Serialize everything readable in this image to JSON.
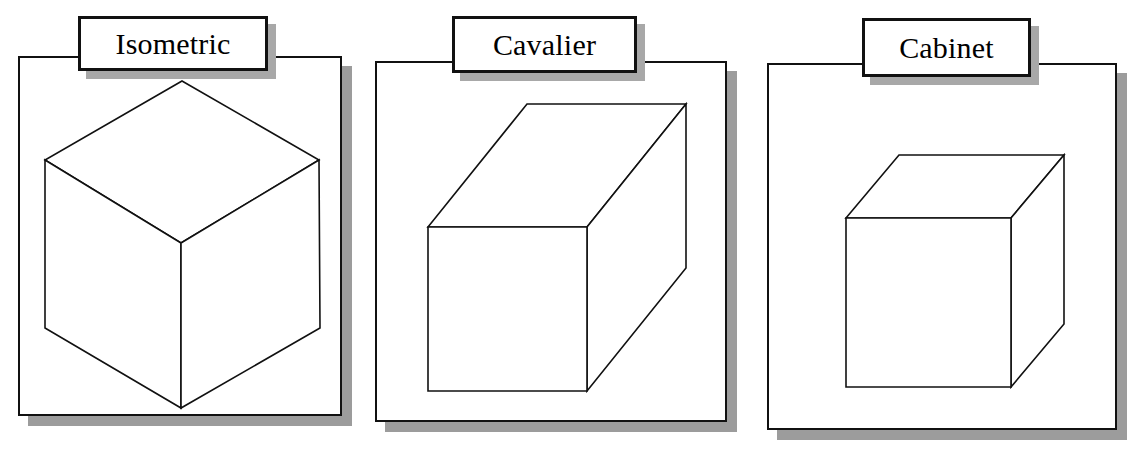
{
  "figure": {
    "background_color": "#ffffff",
    "line_color": "#111111",
    "shadow_color": "#9c9c9c",
    "face_color": "#ffffff"
  },
  "panels": [
    {
      "id": "isometric",
      "label": "Isometric",
      "projection_type": "isometric",
      "frame": {
        "x": 18,
        "y": 56,
        "w": 324,
        "h": 360
      },
      "frame_shadow": {
        "x": 28,
        "y": 66,
        "w": 324,
        "h": 360
      },
      "label_box": {
        "x": 78,
        "y": 16,
        "w": 190,
        "h": 55
      },
      "label_shadow": {
        "x": 86,
        "y": 24,
        "w": 190,
        "h": 55
      },
      "cube": {
        "kind": "isometric-hexagon",
        "viewbox": "0 0 300 340",
        "position": {
          "x": 33,
          "y": 72,
          "w": 300,
          "h": 340
        },
        "vertices": {
          "top": [
            149,
            9
          ],
          "upper_right": [
            286,
            88
          ],
          "upper_left": [
            12,
            88
          ],
          "center": [
            148,
            171
          ],
          "lower_right": [
            287,
            256
          ],
          "lower_left": [
            12,
            256
          ],
          "bottom": [
            148,
            336
          ]
        }
      }
    },
    {
      "id": "cavalier",
      "label": "Cavalier",
      "projection_type": "cavalier oblique",
      "frame": {
        "x": 375,
        "y": 61,
        "w": 352,
        "h": 361
      },
      "frame_shadow": {
        "x": 385,
        "y": 71,
        "w": 352,
        "h": 361
      },
      "label_box": {
        "x": 452,
        "y": 16,
        "w": 185,
        "h": 57
      },
      "label_shadow": {
        "x": 460,
        "y": 24,
        "w": 185,
        "h": 57
      },
      "cube": {
        "kind": "oblique-box",
        "viewbox": "0 0 290 310",
        "position": {
          "x": 415,
          "y": 90,
          "w": 290,
          "h": 310
        },
        "front_face": {
          "x": 13,
          "y": 137,
          "w": 159,
          "h": 164
        },
        "depth_offset": {
          "dx": 99,
          "dy": -123
        }
      }
    },
    {
      "id": "cabinet",
      "label": "Cabinet",
      "projection_type": "cabinet oblique",
      "frame": {
        "x": 767,
        "y": 63,
        "w": 350,
        "h": 367
      },
      "frame_shadow": {
        "x": 777,
        "y": 73,
        "w": 350,
        "h": 367
      },
      "label_box": {
        "x": 862,
        "y": 18,
        "w": 169,
        "h": 59
      },
      "label_shadow": {
        "x": 870,
        "y": 26,
        "w": 169,
        "h": 59
      },
      "cube": {
        "kind": "oblique-box",
        "viewbox": "0 0 240 250",
        "position": {
          "x": 836,
          "y": 145,
          "w": 240,
          "h": 250
        },
        "front_face": {
          "x": 10,
          "y": 73,
          "w": 165,
          "h": 169
        },
        "depth_offset": {
          "dx": 53,
          "dy": -63
        }
      }
    }
  ]
}
